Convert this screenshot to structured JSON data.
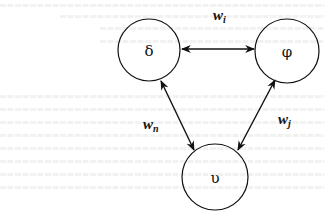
{
  "diagram": {
    "type": "weighted-graph",
    "nodes": [
      {
        "id": "delta",
        "label": "δ",
        "cx": 149,
        "cy": 50,
        "r": 31
      },
      {
        "id": "phi",
        "label": "φ",
        "cx": 287,
        "cy": 51,
        "r": 32
      },
      {
        "id": "upsilon",
        "label": "υ",
        "cx": 215,
        "cy": 177,
        "r": 33
      }
    ],
    "edges": [
      {
        "id": "delta-phi",
        "from": "delta",
        "to": "phi",
        "direction": "bidirectional",
        "weight": {
          "base": "w",
          "sub": "i"
        }
      },
      {
        "id": "delta-upsilon",
        "from": "delta",
        "to": "upsilon",
        "direction": "bidirectional",
        "weight": {
          "base": "w",
          "sub": "n"
        }
      },
      {
        "id": "phi-upsilon",
        "from": "phi",
        "to": "upsilon",
        "direction": "bidirectional",
        "weight": {
          "base": "w",
          "sub": "j"
        }
      }
    ],
    "colors": {
      "stroke": "#111111",
      "background": "#ffffff"
    }
  }
}
